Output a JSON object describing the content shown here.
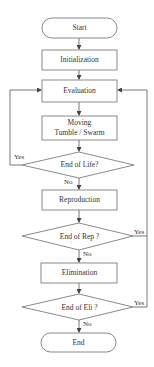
{
  "diagram": {
    "type": "flowchart",
    "nodes": {
      "start": {
        "label": "Start",
        "shape": "terminal"
      },
      "init": {
        "label": "Initialization",
        "shape": "process"
      },
      "eval": {
        "label": "Evaluation",
        "shape": "process"
      },
      "moving": {
        "label_line1": "Moving",
        "label_line2": "Tumble / Swarm",
        "shape": "process"
      },
      "end_life": {
        "label": "End of Life?",
        "shape": "decision"
      },
      "repro": {
        "label": "Reproduction",
        "shape": "process"
      },
      "end_rep": {
        "label": "End of Rep ?",
        "shape": "decision"
      },
      "elim": {
        "label": "Elimination",
        "shape": "process"
      },
      "end_eli": {
        "label": "End of Eli ?",
        "shape": "decision"
      },
      "end": {
        "label": "End",
        "shape": "terminal"
      }
    },
    "edge_labels": {
      "life_yes": "Yes",
      "life_no": "No",
      "rep_yes": "Yes",
      "rep_no": "No",
      "eli_yes": "Yes",
      "eli_no": "No"
    },
    "colors": {
      "stroke": "#6b6b6b",
      "text": "#333333",
      "background": "#ffffff"
    }
  }
}
